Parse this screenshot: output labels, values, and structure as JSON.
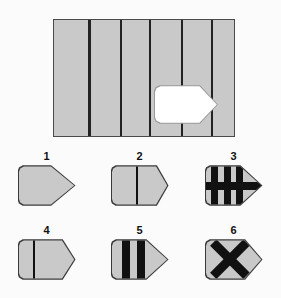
{
  "puzzle": {
    "type": "visual-pattern-completion",
    "title": "",
    "description": "A large gray panel with vertical black stripes contains a blank white tag-shaped cut-out. Six numbered tag-shaped answer options are shown below.",
    "colors": {
      "background": "#fbfbfb",
      "panel_fill": "#c9c9c9",
      "panel_border": "#4a4a4a",
      "stripe": "#222222",
      "cutout_fill": "#ffffff",
      "cutout_border": "#9a9a9a",
      "mark": "#111111",
      "number_text": "#111111"
    }
  },
  "main_panel": {
    "name": "striped-panel",
    "fill": "#c9c9c9",
    "border_color": "#4a4a4a",
    "stripe_color": "#222222",
    "stripe_count": 5,
    "column_count": 6,
    "stripe_positions_pct": [
      19.0,
      36.5,
      52.5,
      70.5,
      87.0
    ],
    "stripe_width_px": 2.6,
    "cutout": {
      "name": "blank-tag-cutout",
      "shape": "tag",
      "fill": "#ffffff",
      "border_color": "#9a9a9a",
      "left_pct": 55.5,
      "top_pct": 56.0,
      "width_px": 64,
      "height_px": 39
    }
  },
  "options": [
    {
      "number": "1",
      "name": "option-1",
      "shape": "tag",
      "width": 58,
      "height": 41,
      "point_depth_pct": 58,
      "marks": [],
      "description": "Plain gray tag, long pointed tip, no markings"
    },
    {
      "number": "2",
      "name": "option-2",
      "shape": "tag",
      "width": 58,
      "height": 41,
      "point_depth_pct": 80,
      "marks": [
        {
          "kind": "vbar",
          "left_pct": 44,
          "width_px": 1.6
        }
      ],
      "description": "Gray tag with one thin vertical line, short blunt tip"
    },
    {
      "number": "3",
      "name": "option-3",
      "shape": "tag",
      "width": 58,
      "height": 41,
      "point_depth_pct": 62,
      "marks": [
        {
          "kind": "vbar",
          "left_pct": 9,
          "width_px": 7
        },
        {
          "kind": "vbar",
          "left_pct": 32,
          "width_px": 7
        },
        {
          "kind": "vbar",
          "left_pct": 55,
          "width_px": 7
        },
        {
          "kind": "hbar",
          "top_pct": 40,
          "height_px": 8
        }
      ],
      "description": "Gray tag with three thick black vertical bars crossed by a horizontal black band"
    },
    {
      "number": "4",
      "name": "option-4",
      "shape": "tag",
      "width": 58,
      "height": 41,
      "point_depth_pct": 78,
      "marks": [
        {
          "kind": "vbar",
          "left_pct": 26,
          "width_px": 1.6
        }
      ],
      "description": "Gray tag with one thin vertical line left of centre, short tip"
    },
    {
      "number": "5",
      "name": "option-5",
      "shape": "tag",
      "width": 58,
      "height": 41,
      "point_depth_pct": 62,
      "marks": [
        {
          "kind": "vbar",
          "left_pct": 19,
          "width_px": 8
        },
        {
          "kind": "vbar",
          "left_pct": 45,
          "width_px": 8
        }
      ],
      "description": "Gray tag with two thick black vertical bars"
    },
    {
      "number": "6",
      "name": "option-6",
      "shape": "tag",
      "width": 58,
      "height": 41,
      "point_depth_pct": 70,
      "marks": [
        {
          "kind": "x",
          "size_pct": 72,
          "arm_thickness_px": 9
        }
      ],
      "description": "Gray tag with a large black X"
    }
  ]
}
